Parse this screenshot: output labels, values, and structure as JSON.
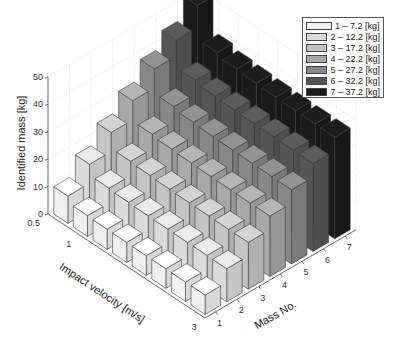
{
  "chart_data": {
    "type": "bar3d",
    "title": "",
    "zlabel": "Identified mass [kg]",
    "xlabel": "Mass No.",
    "ylabel": "Impact velocity [m/s]",
    "zlim": [
      0,
      50
    ],
    "z_ticks": [
      "0",
      "10",
      "20",
      "30",
      "40",
      "50"
    ],
    "velocity_ticks": [
      "0.5",
      "1",
      "3"
    ],
    "mass_ticks": [
      "1",
      "2",
      "3",
      "4",
      "5",
      "6",
      "7"
    ],
    "grid": true,
    "legend_position": "top-right",
    "velocity_levels": 8,
    "series": [
      {
        "name": "1 – 7.2 [kg]",
        "color": "#f0f0f0",
        "values": [
          10.0,
          7.6,
          7.4,
          7.3,
          7.2,
          7.2,
          7.1,
          7.1
        ]
      },
      {
        "name": "2 – 12.2 [kg]",
        "color": "#dadada",
        "values": [
          17.0,
          13.0,
          12.6,
          12.4,
          12.3,
          12.2,
          12.2,
          12.1
        ]
      },
      {
        "name": "3 – 17.2 [kg]",
        "color": "#c4c4c4",
        "values": [
          24.0,
          18.2,
          17.8,
          17.5,
          17.3,
          17.2,
          17.1,
          17.1
        ]
      },
      {
        "name": "4 – 22.2 [kg]",
        "color": "#a8a8a8",
        "values": [
          31.0,
          23.5,
          22.8,
          22.5,
          22.3,
          22.2,
          22.1,
          22.1
        ]
      },
      {
        "name": "5 – 27.2 [kg]",
        "color": "#888888",
        "values": [
          38.0,
          29.0,
          28.0,
          27.6,
          27.4,
          27.3,
          27.2,
          27.1
        ]
      },
      {
        "name": "6 – 32.2 [kg]",
        "color": "#555555",
        "values": [
          44.0,
          34.0,
          33.0,
          32.6,
          32.4,
          32.3,
          32.2,
          32.1
        ]
      },
      {
        "name": "7 – 37.2 [kg]",
        "color": "#1a1a1a",
        "values": [
          52.0,
          39.5,
          38.2,
          37.8,
          37.5,
          37.3,
          37.2,
          37.1
        ]
      }
    ]
  },
  "legend": {
    "items": [
      {
        "label": "1 – 7.2 [kg]",
        "color": "#f0f0f0"
      },
      {
        "label": "2 – 12.2 [kg]",
        "color": "#dadada"
      },
      {
        "label": "3 – 17.2 [kg]",
        "color": "#c4c4c4"
      },
      {
        "label": "4 – 22.2 [kg]",
        "color": "#a8a8a8"
      },
      {
        "label": "5 – 27.2 [kg]",
        "color": "#888888"
      },
      {
        "label": "6 – 32.2 [kg]",
        "color": "#555555"
      },
      {
        "label": "7 – 37.2 [kg]",
        "color": "#1a1a1a"
      }
    ]
  },
  "axes": {
    "z_label": "Identified mass [kg]",
    "velocity_label": "Impact velocity [m/s]",
    "mass_label": "Mass No."
  }
}
